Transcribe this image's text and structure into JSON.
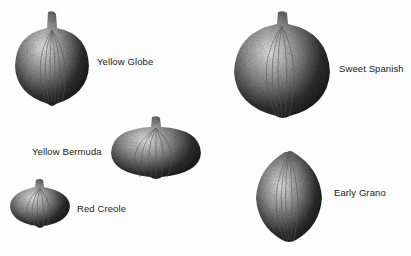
{
  "figure": {
    "varieties": [
      {
        "name": "Yellow Globe"
      },
      {
        "name": "Sweet Spanish"
      },
      {
        "name": "Yellow Bermuda"
      },
      {
        "name": "Red Creole"
      },
      {
        "name": "Early Grano"
      }
    ]
  },
  "colors": {
    "ink": "#1a1a1a",
    "paper": "#fdfdfd"
  }
}
